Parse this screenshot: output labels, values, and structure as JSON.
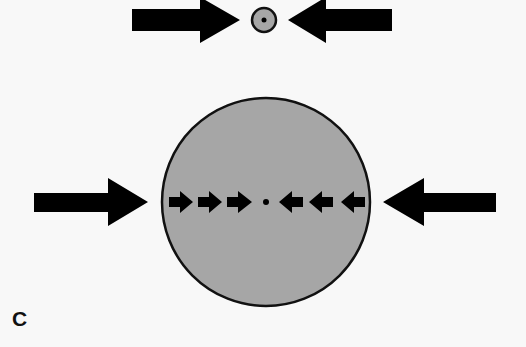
{
  "figure": {
    "panel_label": "C",
    "colors": {
      "arrow": "#000000",
      "sphere_fill": "#a6a6a6",
      "sphere_outline": "#111111",
      "background": "#f8f8f8"
    },
    "top_group": {
      "external_arrows": [
        "right-pointing",
        "left-pointing"
      ],
      "sphere": "small",
      "center_dot": true
    },
    "bottom_group": {
      "external_arrows": [
        "right-pointing",
        "left-pointing"
      ],
      "sphere": "large",
      "internal_arrows_left": 3,
      "internal_arrows_right": 3,
      "center_dot": true
    }
  }
}
